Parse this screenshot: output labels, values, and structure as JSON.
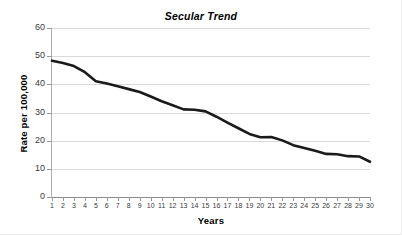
{
  "chart_data": {
    "type": "line",
    "title": "Secular Trend",
    "xlabel": "Years",
    "ylabel": "Rate per 100,000",
    "grid": true,
    "legend": false,
    "xlim": [
      1,
      30
    ],
    "ylim": [
      0,
      60
    ],
    "ytick_values": [
      0,
      10,
      20,
      30,
      40,
      50,
      60
    ],
    "ytick_labels": [
      "0",
      "10",
      "20",
      "30",
      "40",
      "50",
      "60"
    ],
    "categories": [
      1,
      2,
      3,
      4,
      5,
      6,
      7,
      8,
      9,
      10,
      11,
      12,
      13,
      14,
      15,
      16,
      17,
      18,
      19,
      20,
      21,
      22,
      23,
      24,
      25,
      26,
      27,
      28,
      29,
      30
    ],
    "xtick_labels": [
      "1",
      "2",
      "3",
      "4",
      "5",
      "6",
      "7",
      "8",
      "9",
      "10",
      "11",
      "12",
      "13",
      "14",
      "15",
      "16",
      "17",
      "18",
      "19",
      "20",
      "21",
      "22",
      "23",
      "24",
      "25",
      "26",
      "27",
      "28",
      "29",
      "30"
    ],
    "series": [
      {
        "name": "Rate",
        "color": "#1a1a1a",
        "line_width": 2.6,
        "values": [
          48.4,
          47.6,
          46.5,
          44.3,
          41.1,
          40.3,
          39.3,
          38.3,
          37.3,
          35.7,
          34.0,
          32.6,
          31.1,
          31.0,
          30.4,
          28.5,
          26.4,
          24.4,
          22.4,
          21.2,
          21.3,
          20.1,
          18.4,
          17.4,
          16.4,
          15.3,
          15.2,
          14.5,
          14.4,
          12.5
        ]
      }
    ]
  }
}
